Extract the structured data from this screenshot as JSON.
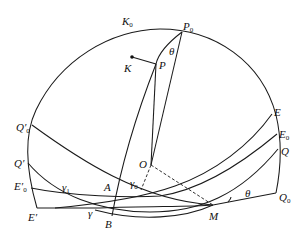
{
  "diagram": {
    "type": "celestial-sphere-geometry",
    "labels": {
      "K0": {
        "main": "K",
        "sub": "0"
      },
      "P0": {
        "main": "P",
        "sub": "0"
      },
      "theta_top": {
        "main": "θ",
        "sub": ""
      },
      "K": {
        "main": "K",
        "sub": ""
      },
      "P": {
        "main": "P",
        "sub": ""
      },
      "Q0p": {
        "main": "Q′",
        "sub": "0"
      },
      "Qp": {
        "main": "Q′",
        "sub": ""
      },
      "E0p": {
        "main": "E′",
        "sub": "0"
      },
      "Ep": {
        "main": "E′",
        "sub": ""
      },
      "gamma1": {
        "main": "γ",
        "sub": "1"
      },
      "gamma": {
        "main": "γ",
        "sub": ""
      },
      "A": {
        "main": "A",
        "sub": ""
      },
      "B": {
        "main": "B",
        "sub": ""
      },
      "O": {
        "main": "O",
        "sub": ""
      },
      "gamma0": {
        "main": "γ",
        "sub": "0"
      },
      "M": {
        "main": "M",
        "sub": ""
      },
      "theta_bottom": {
        "main": "θ",
        "sub": ""
      },
      "E": {
        "main": "E",
        "sub": ""
      },
      "E0": {
        "main": "E",
        "sub": "0"
      },
      "Q": {
        "main": "Q",
        "sub": ""
      },
      "Q0": {
        "main": "Q",
        "sub": "0"
      }
    },
    "points": {
      "P0": [
        182,
        32
      ],
      "P": [
        156,
        64
      ],
      "K": [
        132,
        57
      ],
      "O": [
        151,
        165
      ],
      "A": [
        116,
        190
      ],
      "B": [
        112,
        216
      ],
      "M": [
        213,
        206
      ],
      "Q0p": [
        32,
        125
      ],
      "Qp": [
        28,
        163
      ],
      "E0p": [
        31,
        188
      ],
      "Ep": [
        37,
        208
      ],
      "E": [
        272,
        114
      ],
      "E0": [
        277,
        134
      ],
      "Q": [
        278,
        149
      ],
      "Q0": [
        276,
        193
      ]
    },
    "colors": {
      "stroke": "#1a1a1a",
      "background": "#ffffff"
    }
  }
}
